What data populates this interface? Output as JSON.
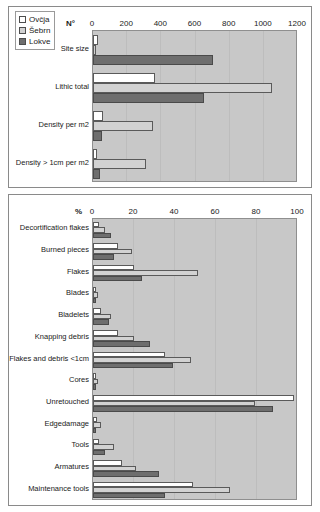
{
  "figure": {
    "legend": {
      "position": "top-left",
      "items": [
        {
          "label": "Ovčja",
          "color": "#ffffff",
          "swatch": "white-open-square"
        },
        {
          "label": "Šebrn",
          "color": "#d2d2d2",
          "swatch": "light-gray-square"
        },
        {
          "label": "Lokve",
          "color": "#6e6e6e",
          "swatch": "dark-gray-square"
        }
      ]
    }
  },
  "chart_data": [
    {
      "type": "bar",
      "orientation": "horizontal",
      "title": "",
      "xlabel": "N°",
      "ylabel": "",
      "xlim": [
        0,
        1200
      ],
      "ticks": [
        "0",
        "200",
        "400",
        "600",
        "800",
        "1000",
        "1200"
      ],
      "tick_values": [
        0,
        200,
        400,
        600,
        800,
        1000,
        1200
      ],
      "grid": true,
      "legend_position": "top-left",
      "categories": [
        "Site size",
        "Lithic total",
        "Density per m2",
        "Density > 1cm per m2"
      ],
      "series": [
        {
          "name": "Ovčja",
          "color": "#ffffff",
          "values": [
            30,
            360,
            60,
            25
          ]
        },
        {
          "name": "Šebrn",
          "color": "#d2d2d2",
          "values": [
            18,
            1050,
            350,
            310
          ]
        },
        {
          "name": "Lokve",
          "color": "#6e6e6e",
          "values": [
            700,
            650,
            55,
            40
          ]
        }
      ]
    },
    {
      "type": "bar",
      "orientation": "horizontal",
      "title": "",
      "xlabel": "%",
      "ylabel": "",
      "xlim": [
        0,
        100
      ],
      "ticks": [
        "0",
        "20",
        "40",
        "60",
        "80",
        "100"
      ],
      "tick_values": [
        0,
        20,
        40,
        60,
        80,
        100
      ],
      "grid": true,
      "categories": [
        "Decortification flakes",
        "Burned pieces",
        "Flakes",
        "Blades",
        "Bladelets",
        "Knapping debris",
        "Flakes and debris <1cm",
        "Cores",
        "Unretouched",
        "Edgedamage",
        "Tools",
        "Armatures",
        "Maintenance tools"
      ],
      "series": [
        {
          "name": "Ovčja",
          "color": "#ffffff",
          "values": [
            3,
            12,
            20,
            1.5,
            4,
            12,
            35,
            1.5,
            98,
            2,
            3,
            14,
            49
          ]
        },
        {
          "name": "Šebrn",
          "color": "#d2d2d2",
          "values": [
            6,
            19,
            51,
            2.5,
            9,
            20,
            48,
            2.5,
            79,
            4,
            10,
            21,
            67
          ]
        },
        {
          "name": "Lokve",
          "color": "#6e6e6e",
          "values": [
            9,
            10,
            24,
            1.5,
            8,
            28,
            39,
            1.5,
            88,
            1.5,
            6,
            32,
            35
          ]
        }
      ]
    }
  ]
}
